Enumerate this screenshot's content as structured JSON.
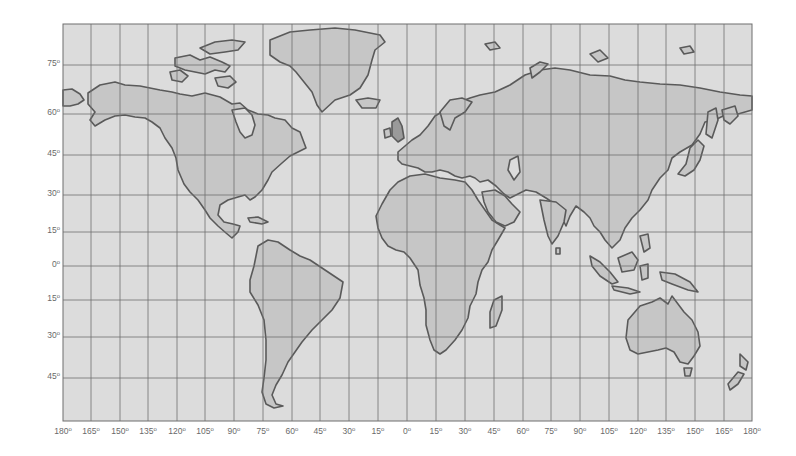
{
  "map": {
    "type": "world-map",
    "projection": "Mercator-style graticule",
    "frame": {
      "left": 63,
      "top": 24,
      "right": 752,
      "bottom": 421
    },
    "colors": {
      "ocean": "#dcdcdc",
      "land": "#c6c6c6",
      "coast": "#5a5a5a",
      "grid": "#6e6e6e",
      "label": "#6a6a6a"
    },
    "latitude_labels": [
      {
        "label": "75",
        "y": 65
      },
      {
        "label": "60",
        "y": 114
      },
      {
        "label": "45",
        "y": 155
      },
      {
        "label": "30",
        "y": 195
      },
      {
        "label": "15",
        "y": 232
      },
      {
        "label": "0",
        "y": 266
      },
      {
        "label": "15",
        "y": 300
      },
      {
        "label": "30",
        "y": 337
      },
      {
        "label": "45",
        "y": 378
      }
    ],
    "longitude_labels": [
      {
        "label": "180",
        "x": 63
      },
      {
        "label": "165",
        "x": 91
      },
      {
        "label": "150",
        "x": 120
      },
      {
        "label": "135",
        "x": 148
      },
      {
        "label": "120",
        "x": 177
      },
      {
        "label": "105",
        "x": 205
      },
      {
        "label": "90",
        "x": 234
      },
      {
        "label": "75",
        "x": 263
      },
      {
        "label": "60",
        "x": 292
      },
      {
        "label": "45",
        "x": 320
      },
      {
        "label": "30",
        "x": 349
      },
      {
        "label": "15",
        "x": 378
      },
      {
        "label": "0",
        "x": 407
      },
      {
        "label": "15",
        "x": 436
      },
      {
        "label": "30",
        "x": 465
      },
      {
        "label": "45",
        "x": 494
      },
      {
        "label": "60",
        "x": 523
      },
      {
        "label": "75",
        "x": 551
      },
      {
        "label": "90",
        "x": 580
      },
      {
        "label": "105",
        "x": 609
      },
      {
        "label": "120",
        "x": 638
      },
      {
        "label": "135",
        "x": 666
      },
      {
        "label": "150",
        "x": 695
      },
      {
        "label": "165",
        "x": 724
      },
      {
        "label": "180",
        "x": 752
      }
    ],
    "degree_symbol": "o",
    "continents": [
      "North America",
      "Greenland",
      "South America",
      "Europe",
      "Africa",
      "Asia",
      "Australia",
      "Antarctica-excluded"
    ]
  }
}
